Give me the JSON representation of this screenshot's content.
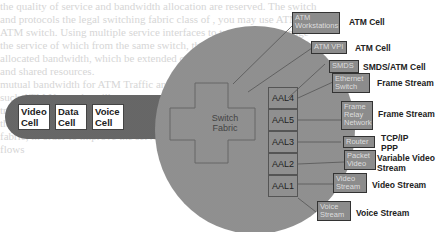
{
  "background_text": [
    "the quality of service and bandwidth allocation are reserved. The switch",
    "and protocols the legal switching fabric class of , you may use ATM to",
    "ATM switch. Using multiple service interfaces to transfer and manage",
    "the service of which from the same switch, the fabric and standards of",
    "allocated bandwidth, which be extended over multiple stations are",
    "                              and shared resources.",
    "                          mutual bandwidth for ATM Traffic and IP, and",
    "                        such ATM Networks will carry",
    "                        traffic through a user, into the",
    "                      that carries voice, video and data ATM traffic",
    "                      fabric, in order to improve the service.",
    "                      flows"
  ],
  "diagram": {
    "input_pipe": {
      "cells": [
        {
          "label": "Video Cell"
        },
        {
          "label": "Data Cell"
        },
        {
          "label": "Voice Cell"
        }
      ]
    },
    "switch_fabric": {
      "label": "Switch Fabric"
    },
    "aal_layers": [
      {
        "label": "AAL4"
      },
      {
        "label": "AAL5"
      },
      {
        "label": "AAL3"
      },
      {
        "label": "AAL2"
      },
      {
        "label": "AAL1"
      }
    ],
    "endpoints": [
      {
        "device": "ATM Workstations",
        "output": "ATM Cell"
      },
      {
        "device": "ATM VPI",
        "output": "ATM Cell"
      },
      {
        "device": "SMDS",
        "output": "SMDS/ATM Cell"
      },
      {
        "device": "Ethernet Switch",
        "output": "Frame Stream"
      },
      {
        "device": "Frame Relay Network",
        "output": "Frame Stream"
      },
      {
        "device": "Router",
        "output": "TCP/IP PPP"
      },
      {
        "device": "Packet Video",
        "output": "Variable Video Stream"
      },
      {
        "device": "Video Stream",
        "output": "Video Stream"
      },
      {
        "device": "Voice Stream",
        "output": "Voice Stream"
      }
    ],
    "colors": {
      "circle": "#9a9a9a",
      "pipe": "#6f6f6f",
      "device_box": "#8c8c8c",
      "cell_box": "#ffffff"
    }
  }
}
